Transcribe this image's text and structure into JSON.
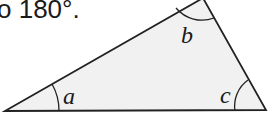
{
  "caption": "o 180°.",
  "diagram": {
    "type": "triangle",
    "fill": "#f1f1f1",
    "stroke": "#222222",
    "vertices": {
      "left": [
        5,
        111
      ],
      "top": [
        203,
        0
      ],
      "right": [
        266,
        110
      ]
    },
    "angles": [
      {
        "label": "a",
        "vertex": "left"
      },
      {
        "label": "b",
        "vertex": "top"
      },
      {
        "label": "c",
        "vertex": "right"
      }
    ]
  }
}
